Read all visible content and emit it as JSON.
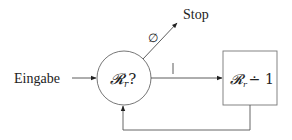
{
  "diagram": {
    "input_label": "Eingabe",
    "decision_label": "𝓡",
    "decision_subscript": "r",
    "decision_suffix": "?",
    "stop_label": "Stop",
    "empty_set_label": "∅",
    "nonempty_mark": "|",
    "action_label": "𝓡",
    "action_subscript": "r",
    "action_suffix": "∸ 1"
  }
}
